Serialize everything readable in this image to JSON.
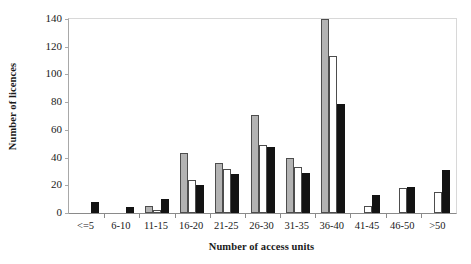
{
  "chart_data": {
    "type": "bar",
    "title": "",
    "xlabel": "Number of access units",
    "ylabel": "Number of licences",
    "categories": [
      "<=5",
      "6-10",
      "11-15",
      "16-20",
      "21-25",
      "26-30",
      "31-35",
      "36-40",
      "41-45",
      "46-50",
      ">50"
    ],
    "ylim": [
      0,
      140
    ],
    "yticks": [
      0,
      20,
      40,
      60,
      80,
      100,
      120,
      140
    ],
    "ytick_labels": [
      "0",
      "20",
      "40",
      "60",
      "80",
      "100",
      "120",
      "140"
    ],
    "grid": false,
    "legend": "none",
    "series": [
      {
        "name": "series-grey",
        "color": "#b3b3b3",
        "values": [
          0,
          0,
          5,
          43,
          36,
          71,
          40,
          140,
          0,
          0,
          0
        ]
      },
      {
        "name": "series-white",
        "color": "#ffffff",
        "values": [
          0,
          0,
          2,
          24,
          32,
          49,
          33,
          113,
          5,
          18,
          15
        ]
      },
      {
        "name": "series-black",
        "color": "#131313",
        "values": [
          8,
          4,
          10,
          20,
          28,
          48,
          29,
          79,
          13,
          19,
          31
        ]
      }
    ]
  }
}
